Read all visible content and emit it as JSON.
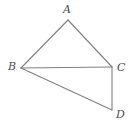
{
  "figure": {
    "type": "geometry-diagram",
    "background_color": "#ffffff",
    "line_color": "#808080",
    "label_color": "#4d4d4d",
    "stroke_width": 1.1,
    "canvas": {
      "width": 135,
      "height": 130
    },
    "vertices": [
      {
        "id": "A",
        "label": "A",
        "x": 68,
        "y": 20,
        "label_x": 63,
        "label_y": 4
      },
      {
        "id": "B",
        "label": "B",
        "x": 21,
        "y": 68,
        "label_x": 8,
        "label_y": 61
      },
      {
        "id": "C",
        "label": "C",
        "x": 112,
        "y": 67,
        "label_x": 117,
        "label_y": 62
      },
      {
        "id": "D",
        "label": "D",
        "x": 112,
        "y": 110,
        "label_x": 116,
        "label_y": 109
      }
    ],
    "segments": [
      {
        "id": "AB",
        "from": "A",
        "to": "B",
        "x1": 68,
        "y1": 20,
        "x2": 21,
        "y2": 68
      },
      {
        "id": "AC",
        "from": "A",
        "to": "C",
        "x1": 68,
        "y1": 20,
        "x2": 112,
        "y2": 67
      },
      {
        "id": "BC",
        "from": "B",
        "to": "C",
        "x1": 21,
        "y1": 68,
        "x2": 112,
        "y2": 67
      },
      {
        "id": "BD",
        "from": "B",
        "to": "D",
        "x1": 21,
        "y1": 68,
        "x2": 112,
        "y2": 110
      },
      {
        "id": "CD",
        "from": "C",
        "to": "D",
        "x1": 112,
        "y1": 67,
        "x2": 112,
        "y2": 110
      }
    ]
  }
}
